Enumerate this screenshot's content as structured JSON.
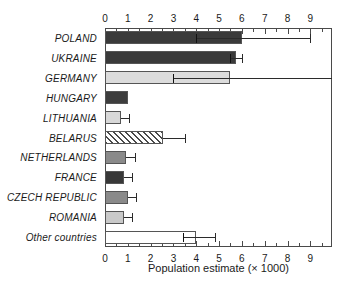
{
  "chart_data": {
    "type": "bar",
    "orientation": "horizontal",
    "title": "",
    "xlabel": "Population estimate (× 1000)",
    "ylabel": "",
    "xlim": [
      0,
      9.95
    ],
    "xticks": [
      0,
      1,
      2,
      3,
      4,
      5,
      6,
      7,
      8,
      9
    ],
    "xticklabels": [
      "0",
      "1",
      "2",
      "3",
      "4",
      "5",
      "6",
      "7",
      "8",
      "9"
    ],
    "minor_tick_interval": 0.5,
    "grid": false,
    "legend": "none",
    "axis_positions": [
      "top",
      "bottom"
    ],
    "categories": [
      "POLAND",
      "UKRAINE",
      "GERMANY",
      "HUNGARY",
      "LITHUANIA",
      "BELARUS",
      "NETHERLANDS",
      "FRANCE",
      "CZECH REPUBLIC",
      "ROMANIA",
      "Other countries"
    ],
    "values": [
      6.0,
      5.75,
      5.5,
      1.0,
      0.7,
      2.55,
      0.9,
      0.85,
      1.0,
      0.85,
      4.0
    ],
    "error_low": [
      4.0,
      5.5,
      3.0,
      null,
      0.7,
      2.55,
      0.9,
      0.85,
      1.0,
      0.85,
      3.4
    ],
    "error_high": [
      9.0,
      6.0,
      9.95,
      null,
      1.05,
      3.5,
      1.3,
      1.2,
      1.35,
      1.2,
      4.8
    ],
    "bar_fills": [
      "#3a3a3a",
      "#3a3a3a",
      "#dcdcdc",
      "#3d3d3d",
      "#d8d8d8",
      "hatch",
      "#8a8a8a",
      "#383838",
      "#8a8a8a",
      "#c9c9c9",
      "#ffffff"
    ]
  },
  "colors": {
    "axis": "#4a4a4a",
    "bar_edge": "#555555",
    "error_bar": "#2b2b2b",
    "background": "#ffffff",
    "text": "#1a1a1a"
  }
}
